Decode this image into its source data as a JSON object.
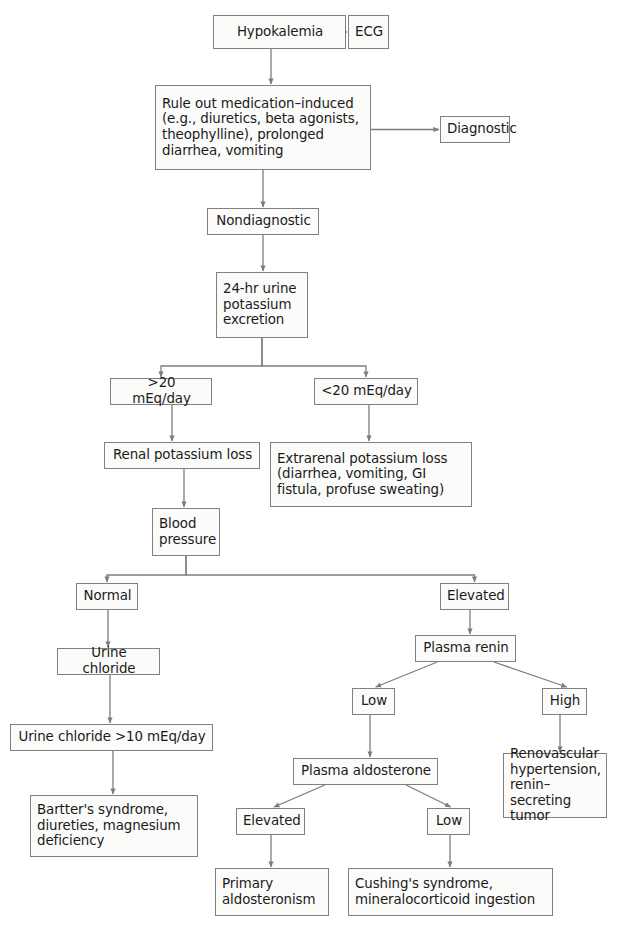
{
  "diagram": {
    "type": "flowchart",
    "width": 625,
    "height": 936,
    "style": {
      "box_border_color": "#808080",
      "box_fill_color": "#fbfbfa",
      "text_color": "#1a1a1a",
      "edge_color": "#7d7d7d"
    },
    "top_caption": "",
    "nodes": [
      {
        "id": "hypokalemia",
        "label": "Hypokalemia",
        "x": 213,
        "y": 15,
        "w": 133,
        "h": 34,
        "align": "center"
      },
      {
        "id": "ecg",
        "label": "ECG",
        "x": 348,
        "y": 15,
        "w": 41,
        "h": 34,
        "align": "center"
      },
      {
        "id": "rule-out",
        "label": "Rule out medication–induced\n(e.g., diuretics, beta agonists,\ntheophylline), prolonged\ndiarrhea, vomiting",
        "x": 155,
        "y": 85,
        "w": 216,
        "h": 85,
        "align": "left"
      },
      {
        "id": "diagnostic",
        "label": "Diagnostic",
        "x": 440,
        "y": 116,
        "w": 70,
        "h": 27,
        "align": "center"
      },
      {
        "id": "nondiagnostic",
        "label": "Nondiagnostic",
        "x": 207,
        "y": 208,
        "w": 112,
        "h": 27,
        "align": "center"
      },
      {
        "id": "urine-potassium",
        "label": "24-hr urine\npotassium\nexcretion",
        "x": 216,
        "y": 272,
        "w": 92,
        "h": 66,
        "align": "left"
      },
      {
        "id": "gt20",
        "label": ">20 mEq/day",
        "x": 110,
        "y": 378,
        "w": 102,
        "h": 27,
        "align": "center"
      },
      {
        "id": "lt20",
        "label": "<20 mEq/day",
        "x": 314,
        "y": 378,
        "w": 104,
        "h": 27,
        "align": "center"
      },
      {
        "id": "renal-loss",
        "label": "Renal potassium loss",
        "x": 104,
        "y": 442,
        "w": 156,
        "h": 27,
        "align": "center"
      },
      {
        "id": "extrarenal-loss",
        "label": "Extrarenal potassium loss\n(diarrhea, vomiting, GI\nfistula, profuse sweating)",
        "x": 270,
        "y": 442,
        "w": 202,
        "h": 65,
        "align": "left"
      },
      {
        "id": "blood-pressure",
        "label": "Blood\npressure",
        "x": 152,
        "y": 508,
        "w": 68,
        "h": 48,
        "align": "left"
      },
      {
        "id": "normal",
        "label": "Normal",
        "x": 76,
        "y": 583,
        "w": 62,
        "h": 27,
        "align": "center"
      },
      {
        "id": "elevated-bp",
        "label": "Elevated",
        "x": 440,
        "y": 583,
        "w": 69,
        "h": 27,
        "align": "center"
      },
      {
        "id": "urine-chloride",
        "label": "Urine chloride",
        "x": 57,
        "y": 648,
        "w": 103,
        "h": 27,
        "align": "center"
      },
      {
        "id": "plasma-renin",
        "label": "Plasma renin",
        "x": 415,
        "y": 635,
        "w": 101,
        "h": 27,
        "align": "center"
      },
      {
        "id": "urine-chloride-gt10",
        "label": "Urine chloride >10 mEq/day",
        "x": 10,
        "y": 724,
        "w": 203,
        "h": 27,
        "align": "center"
      },
      {
        "id": "renin-low",
        "label": "Low",
        "x": 352,
        "y": 688,
        "w": 43,
        "h": 27,
        "align": "center"
      },
      {
        "id": "renin-high",
        "label": "High",
        "x": 542,
        "y": 688,
        "w": 45,
        "h": 27,
        "align": "center"
      },
      {
        "id": "renovascular",
        "label": "Renovascular\nhypertension,\nrenin–secreting\ntumor",
        "x": 503,
        "y": 753,
        "w": 104,
        "h": 65,
        "align": "left"
      },
      {
        "id": "plasma-aldosterone",
        "label": "Plasma aldosterone",
        "x": 293,
        "y": 758,
        "w": 145,
        "h": 27,
        "align": "center"
      },
      {
        "id": "aldo-elevated",
        "label": "Elevated",
        "x": 236,
        "y": 808,
        "w": 69,
        "h": 27,
        "align": "center"
      },
      {
        "id": "aldo-low",
        "label": "Low",
        "x": 427,
        "y": 808,
        "w": 43,
        "h": 27,
        "align": "center"
      },
      {
        "id": "bartter",
        "label": "Bartter's syndrome,\ndiureties, magnesium\ndeficiency",
        "x": 30,
        "y": 795,
        "w": 168,
        "h": 62,
        "align": "left"
      },
      {
        "id": "primary-aldosteronism",
        "label": "Primary\naldosteronism",
        "x": 215,
        "y": 868,
        "w": 114,
        "h": 48,
        "align": "left"
      },
      {
        "id": "cushings",
        "label": "Cushing's syndrome,\nmineralocorticoid ingestion",
        "x": 348,
        "y": 868,
        "w": 205,
        "h": 48,
        "align": "left"
      }
    ],
    "edges": [
      {
        "id": "e-hypo-ecg",
        "from": "hypokalemia",
        "to": "ecg",
        "kind": "h",
        "arrow": true
      },
      {
        "id": "e-hypo-ruleout",
        "from": "hypokalemia",
        "to": "rule-out",
        "kind": "v",
        "arrow": true
      },
      {
        "id": "e-ruleout-diag",
        "from": "rule-out",
        "to": "diagnostic",
        "kind": "h",
        "arrow": true
      },
      {
        "id": "e-ruleout-nondiag",
        "from": "rule-out",
        "to": "nondiagnostic",
        "kind": "v",
        "arrow": true
      },
      {
        "id": "e-nondiag-urine",
        "from": "nondiagnostic",
        "to": "urine-potassium",
        "kind": "v",
        "arrow": true
      },
      {
        "id": "e-urine-gt20",
        "from": "urine-potassium",
        "to": "gt20",
        "kind": "split",
        "arrow": true,
        "stem": 28
      },
      {
        "id": "e-urine-lt20",
        "from": "urine-potassium",
        "to": "lt20",
        "kind": "split",
        "arrow": true,
        "stem": 28
      },
      {
        "id": "e-gt20-renal",
        "from": "gt20",
        "to": "renal-loss",
        "kind": "v",
        "arrow": true
      },
      {
        "id": "e-lt20-extra",
        "from": "lt20",
        "to": "extrarenal-loss",
        "kind": "v",
        "arrow": true
      },
      {
        "id": "e-renal-bp",
        "from": "renal-loss",
        "to": "blood-pressure",
        "kind": "v",
        "arrow": true
      },
      {
        "id": "e-bp-normal",
        "from": "blood-pressure",
        "to": "normal",
        "kind": "split",
        "arrow": true,
        "stem": 19
      },
      {
        "id": "e-bp-elevated",
        "from": "blood-pressure",
        "to": "elevated-bp",
        "kind": "split",
        "arrow": true,
        "stem": 19
      },
      {
        "id": "e-normal-uricl",
        "from": "normal",
        "to": "urine-chloride",
        "kind": "v",
        "arrow": true
      },
      {
        "id": "e-uricl-gt10",
        "from": "urine-chloride",
        "to": "urine-chloride-gt10",
        "kind": "v",
        "arrow": true
      },
      {
        "id": "e-gt10-bartter",
        "from": "urine-chloride-gt10",
        "to": "bartter",
        "kind": "v",
        "arrow": true
      },
      {
        "id": "e-elev-renin",
        "from": "elevated-bp",
        "to": "plasma-renin",
        "kind": "v",
        "arrow": true
      },
      {
        "id": "e-renin-low",
        "from": "plasma-renin",
        "to": "renin-low",
        "kind": "diag",
        "arrow": true
      },
      {
        "id": "e-renin-high",
        "from": "plasma-renin",
        "to": "renin-high",
        "kind": "diag",
        "arrow": true
      },
      {
        "id": "e-high-renov",
        "from": "renin-high",
        "to": "renovascular",
        "kind": "v",
        "arrow": true
      },
      {
        "id": "e-low-aldo",
        "from": "renin-low",
        "to": "plasma-aldosterone",
        "kind": "v",
        "arrow": true
      },
      {
        "id": "e-aldo-elev",
        "from": "plasma-aldosterone",
        "to": "aldo-elevated",
        "kind": "diag",
        "arrow": true
      },
      {
        "id": "e-aldo-low",
        "from": "plasma-aldosterone",
        "to": "aldo-low",
        "kind": "diag",
        "arrow": true
      },
      {
        "id": "e-elev-primary",
        "from": "aldo-elevated",
        "to": "primary-aldosteronism",
        "kind": "v",
        "arrow": true
      },
      {
        "id": "e-low-cushings",
        "from": "aldo-low",
        "to": "cushings",
        "kind": "v",
        "arrow": true
      }
    ]
  }
}
